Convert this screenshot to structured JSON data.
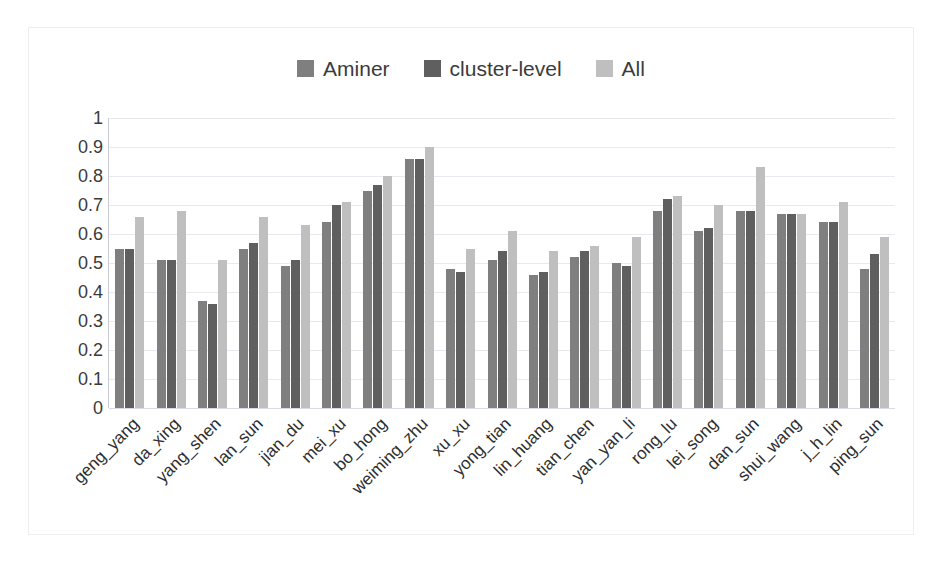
{
  "chart_data": {
    "type": "bar",
    "title": "",
    "xlabel": "",
    "ylabel": "",
    "ylim": [
      0,
      1
    ],
    "grid": true,
    "legend_position": "top-center",
    "y_ticks": [
      "1",
      "0.9",
      "0.8",
      "0.7",
      "0.6",
      "0.5",
      "0.4",
      "0.3",
      "0.2",
      "0.1",
      "0"
    ],
    "y_tick_values": [
      1,
      0.9,
      0.8,
      0.7,
      0.6,
      0.5,
      0.4,
      0.3,
      0.2,
      0.1,
      0
    ],
    "categories": [
      "geng_yang",
      "da_xing",
      "yang_shen",
      "lan_sun",
      "jian_du",
      "mei_xu",
      "bo_hong",
      "weiming_zhu",
      "xu_xu",
      "yong_tian",
      "lin_huang",
      "tian_chen",
      "yan_yan_li",
      "rong_lu",
      "lei_song",
      "dan_sun",
      "shui_wang",
      "j_h_lin",
      "ping_sun"
    ],
    "series": [
      {
        "name": "Aminer",
        "color": "#7f7f7f",
        "values": [
          0.55,
          0.51,
          0.37,
          0.55,
          0.49,
          0.64,
          0.75,
          0.86,
          0.48,
          0.51,
          0.46,
          0.52,
          0.5,
          0.68,
          0.61,
          0.68,
          0.67,
          0.64,
          0.48
        ]
      },
      {
        "name": "cluster-level",
        "color": "#5f5f5f",
        "values": [
          0.55,
          0.51,
          0.36,
          0.57,
          0.51,
          0.7,
          0.77,
          0.86,
          0.47,
          0.54,
          0.47,
          0.54,
          0.49,
          0.72,
          0.62,
          0.68,
          0.67,
          0.64,
          0.53
        ]
      },
      {
        "name": "All",
        "color": "#bfbfbf",
        "values": [
          0.66,
          0.68,
          0.51,
          0.66,
          0.63,
          0.71,
          0.8,
          0.9,
          0.55,
          0.61,
          0.54,
          0.56,
          0.59,
          0.73,
          0.7,
          0.83,
          0.67,
          0.71,
          0.59
        ]
      }
    ]
  }
}
